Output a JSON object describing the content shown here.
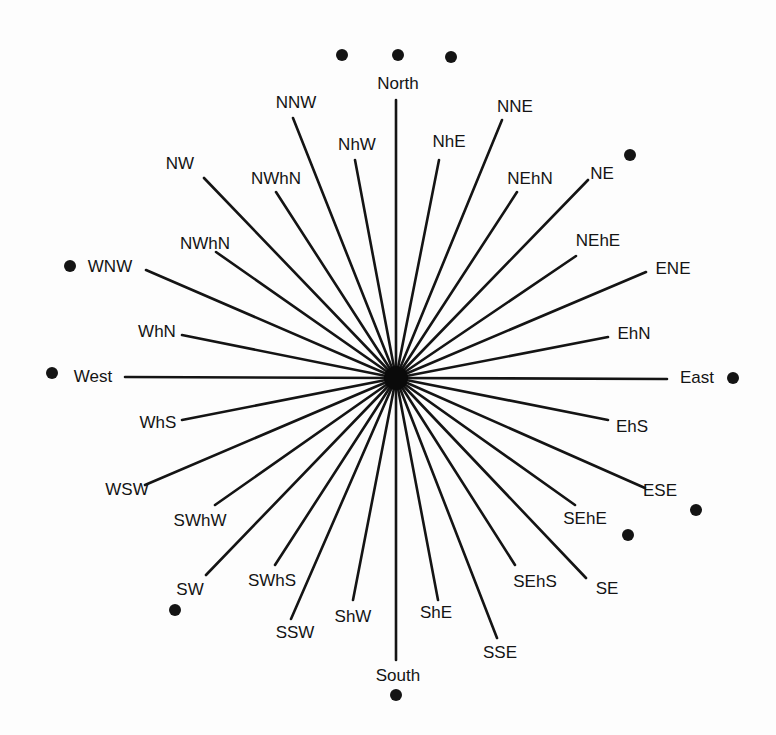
{
  "diagram": {
    "type": "compass-rose",
    "center": {
      "x": 396,
      "y": 378
    },
    "points": [
      {
        "label": "North",
        "end": [
          396,
          100
        ],
        "label_pos": [
          398,
          85
        ]
      },
      {
        "label": "NhE",
        "end": [
          439,
          160
        ],
        "label_pos": [
          449,
          143
        ]
      },
      {
        "label": "NNE",
        "end": [
          502,
          120
        ],
        "label_pos": [
          515,
          108
        ]
      },
      {
        "label": "NEhN",
        "end": [
          517,
          192
        ],
        "label_pos": [
          530,
          180
        ]
      },
      {
        "label": "NE",
        "end": [
          588,
          180
        ],
        "label_pos": [
          602,
          175
        ]
      },
      {
        "label": "NEhE",
        "end": [
          576,
          256
        ],
        "label_pos": [
          598,
          242
        ]
      },
      {
        "label": "ENE",
        "end": [
          646,
          272
        ],
        "label_pos": [
          673,
          270
        ]
      },
      {
        "label": "EhN",
        "end": [
          608,
          337
        ],
        "label_pos": [
          634,
          335
        ]
      },
      {
        "label": "East",
        "end": [
          667,
          379
        ],
        "label_pos": [
          697,
          379
        ]
      },
      {
        "label": "EhS",
        "end": [
          608,
          420
        ],
        "label_pos": [
          632,
          428
        ]
      },
      {
        "label": "ESE",
        "end": [
          645,
          488
        ],
        "label_pos": [
          660,
          492
        ]
      },
      {
        "label": "SEhE",
        "end": [
          575,
          505
        ],
        "label_pos": [
          585,
          520
        ]
      },
      {
        "label": "SE",
        "end": [
          586,
          578
        ],
        "label_pos": [
          607,
          590
        ]
      },
      {
        "label": "SEhS",
        "end": [
          515,
          565
        ],
        "label_pos": [
          535,
          583
        ]
      },
      {
        "label": "SSE",
        "end": [
          497,
          638
        ],
        "label_pos": [
          500,
          654
        ]
      },
      {
        "label": "ShE",
        "end": [
          438,
          600
        ],
        "label_pos": [
          436,
          614
        ]
      },
      {
        "label": "South",
        "end": [
          396,
          660
        ],
        "label_pos": [
          398,
          677
        ]
      },
      {
        "label": "ShW",
        "end": [
          353,
          600
        ],
        "label_pos": [
          353,
          618
        ]
      },
      {
        "label": "SSW",
        "end": [
          291,
          619
        ],
        "label_pos": [
          295,
          634
        ]
      },
      {
        "label": "SWhS",
        "end": [
          275,
          565
        ],
        "label_pos": [
          272,
          582
        ]
      },
      {
        "label": "SW",
        "end": [
          206,
          575
        ],
        "label_pos": [
          190,
          591
        ]
      },
      {
        "label": "SWhW",
        "end": [
          215,
          505
        ],
        "label_pos": [
          200,
          522
        ]
      },
      {
        "label": "WSW",
        "end": [
          145,
          485
        ],
        "label_pos": [
          127,
          491
        ]
      },
      {
        "label": "WhS",
        "end": [
          182,
          420
        ],
        "label_pos": [
          158,
          424
        ]
      },
      {
        "label": "West",
        "end": [
          125,
          377
        ],
        "label_pos": [
          93,
          378
        ]
      },
      {
        "label": "WhN",
        "end": [
          182,
          335
        ],
        "label_pos": [
          157,
          333
        ]
      },
      {
        "label": "WNW",
        "end": [
          146,
          270
        ],
        "label_pos": [
          110,
          268
        ]
      },
      {
        "label": "NWhN",
        "end": [
          216,
          252
        ],
        "label_pos": [
          205,
          245
        ]
      },
      {
        "label": "NW",
        "end": [
          204,
          178
        ],
        "label_pos": [
          180,
          165
        ]
      },
      {
        "label": "NWhN",
        "end": [
          276,
          192
        ],
        "label_pos": [
          276,
          180
        ]
      },
      {
        "label": "NhW",
        "end": [
          355,
          160
        ],
        "label_pos": [
          357,
          146
        ]
      },
      {
        "label": "NNW",
        "end": [
          293,
          118
        ],
        "label_pos": [
          296,
          104
        ]
      }
    ],
    "dots": [
      {
        "name": "north-dot-left",
        "pos": [
          342,
          55
        ]
      },
      {
        "name": "north-dot-center",
        "pos": [
          398,
          55
        ]
      },
      {
        "name": "north-dot-right",
        "pos": [
          451,
          57
        ]
      },
      {
        "name": "ne-dot",
        "pos": [
          630,
          155
        ]
      },
      {
        "name": "east-dot",
        "pos": [
          733,
          378
        ]
      },
      {
        "name": "ese-dot",
        "pos": [
          696,
          510
        ]
      },
      {
        "name": "sehe-dot",
        "pos": [
          628,
          535
        ]
      },
      {
        "name": "south-dot",
        "pos": [
          396,
          695
        ]
      },
      {
        "name": "sw-dot",
        "pos": [
          175,
          610
        ]
      },
      {
        "name": "west-dot",
        "pos": [
          52,
          373
        ]
      },
      {
        "name": "wnw-dot",
        "pos": [
          70,
          266
        ]
      }
    ],
    "colors": {
      "ink": "#141414",
      "background": "#fdfdfd"
    }
  }
}
